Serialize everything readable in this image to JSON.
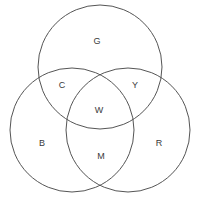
{
  "diagram": {
    "type": "venn-3-circle",
    "canvas": {
      "width": 199,
      "height": 200
    },
    "stroke_color": "#555555",
    "background_color": "#ffffff",
    "text_color": "#3a3a3a",
    "circles": [
      {
        "id": "top",
        "name": "green-circle",
        "cx": 100,
        "cy": 67,
        "r": 62
      },
      {
        "id": "left",
        "name": "blue-circle",
        "cx": 72,
        "cy": 130,
        "r": 62
      },
      {
        "id": "right",
        "name": "red-circle",
        "cx": 128,
        "cy": 130,
        "r": 62
      }
    ],
    "labels": [
      {
        "id": "G",
        "text": "G",
        "meaning": "green",
        "x": 97,
        "y": 41,
        "region": "top-only"
      },
      {
        "id": "C",
        "text": "C",
        "meaning": "cyan",
        "x": 62,
        "y": 85,
        "region": "top-and-left"
      },
      {
        "id": "Y",
        "text": "Y",
        "meaning": "yellow",
        "x": 135,
        "y": 85,
        "region": "top-and-right"
      },
      {
        "id": "W",
        "text": "W",
        "meaning": "white",
        "x": 99,
        "y": 110,
        "region": "all-three"
      },
      {
        "id": "B",
        "text": "B",
        "meaning": "blue",
        "x": 42,
        "y": 143,
        "region": "left-only"
      },
      {
        "id": "M",
        "text": "M",
        "meaning": "magenta",
        "x": 101,
        "y": 156,
        "region": "left-and-right"
      },
      {
        "id": "R",
        "text": "R",
        "meaning": "red",
        "x": 159,
        "y": 143,
        "region": "right-only"
      }
    ]
  }
}
